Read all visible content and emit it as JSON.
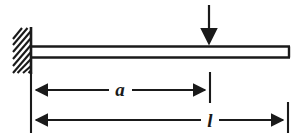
{
  "diagram": {
    "type": "engineering-mechanics-beam-diagram",
    "background_color": "#ffffff",
    "line_color": "#1a1a1a",
    "support": {
      "name": "fixed-support",
      "kind": "fixed-wall-hatched",
      "wall_line_x": 31,
      "wall_top_y": 28,
      "wall_bottom_y": 73,
      "hatch_left_x": 13,
      "hatch_right_x": 31,
      "hatch_count": 9,
      "hatch_direction": "lower-left-to-upper-right"
    },
    "beam": {
      "name": "beam",
      "left_x": 31,
      "right_x": 290,
      "top_y": 46,
      "bottom_y": 58
    },
    "load": {
      "name": "point-load-arrow",
      "label": "",
      "direction": "down",
      "x": 209,
      "start_y": 5,
      "tip_y": 46
    },
    "dimensions": [
      {
        "name": "dimension-a",
        "label": "a",
        "from_x": 31,
        "to_x": 210,
        "y": 90,
        "label_x": 120,
        "arrow_both_ends": true
      },
      {
        "name": "dimension-l",
        "label": "l",
        "from_x": 31,
        "to_x": 288,
        "y": 120,
        "label_x": 210,
        "arrow_both_ends": true
      }
    ],
    "extension_lines": [
      {
        "name": "extension-line-left",
        "x": 31,
        "y1": 72,
        "y2": 133
      },
      {
        "name": "extension-line-middle",
        "x": 210,
        "y1": 72,
        "y2": 103
      },
      {
        "name": "extension-line-right",
        "x": 288,
        "y1": 102,
        "y2": 133
      }
    ]
  }
}
